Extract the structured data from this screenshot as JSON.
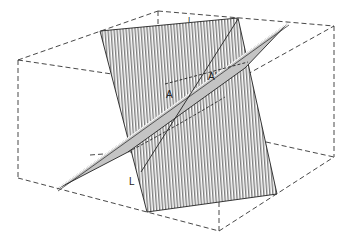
{
  "diagram": {
    "type": "3D block diagram of two intersecting planes",
    "labels": {
      "point_a": "A",
      "point_a_prime": "A'",
      "line_l": "L",
      "top_mark": "I"
    },
    "colors": {
      "background": "#ffffff",
      "lines": "#222222",
      "gray_plane_fill": "#c4c4c4",
      "hatch": "#333333"
    },
    "elements": [
      "dashed bounding box",
      "vertically hatched steep plane",
      "gray shaded inclined plane",
      "intersection line through A and A'",
      "line L"
    ]
  }
}
